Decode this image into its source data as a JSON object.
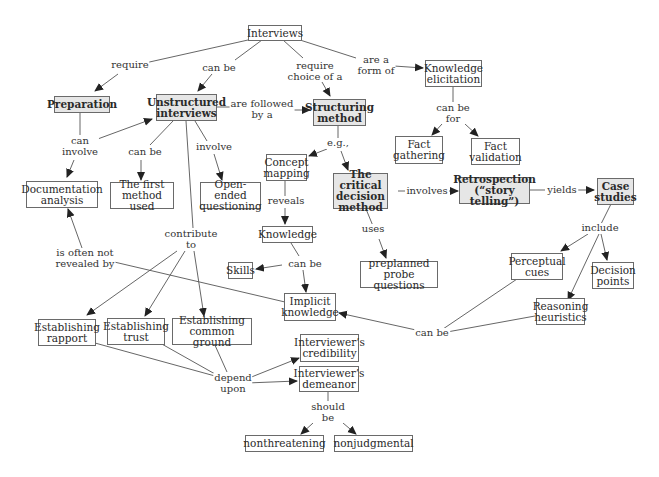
{
  "nodes": {
    "interviews": "Interviews",
    "preparation": "Preparation",
    "unstructured": "Unstructured\ninterviews",
    "structuring": "Structuring\nmethod",
    "knowledge_elicitation": "Knowledge\nelicitation",
    "fact_gathering": "Fact\ngathering",
    "fact_validation": "Fact\nvalidation",
    "documentation": "Documentation\nanalysis",
    "first_method": "The first\nmethod used",
    "open_ended": "Open-ended\nquestioning",
    "concept_mapping": "Concept\nmapping",
    "critical_decision": "The critical\ndecision\nmethod",
    "retrospection": "Retrospection\n(“story telling”)",
    "case_studies": "Case\nstudies",
    "knowledge": "Knowledge",
    "skills": "Skills",
    "preplanned": "preplanned\nprobe questions",
    "perceptual_cues": "Perceptual\ncues",
    "decision_points": "Decision\npoints",
    "implicit_knowledge": "Implicit\nknowledge",
    "reasoning_heuristics": "Reasoning\nheuristics",
    "rapport": "Establishing\nrapport",
    "trust": "Establishing\ntrust",
    "common_ground": "Establishing\ncommon ground",
    "credibility": "Interviewer’s\ncredibility",
    "demeanor": "Interviewer’s\ndemeanor",
    "nonthreatening": "nonthreatening",
    "nonjudgmental": "nonjudgmental"
  },
  "links": {
    "require": "require",
    "can_be_1": "can be",
    "require_choice": "require\nchoice of a",
    "are_a_form_of": "are a\nform of",
    "can_involve": "can\ninvolve",
    "are_followed_by": "are followed\nby a",
    "can_be_2": "can be",
    "involve": "involve",
    "can_be_for": "can be\nfor",
    "eg": "e.g.,",
    "involves": "involves",
    "yields": "yields",
    "reveals": "reveals",
    "uses": "uses",
    "include": "include",
    "contribute_to": "contribute\nto",
    "is_often_not": "is often not\nrevealed by",
    "can_be_3": "can be",
    "can_be_4": "can be",
    "depend_upon": "depend\nupon",
    "should_be": "should\nbe"
  }
}
